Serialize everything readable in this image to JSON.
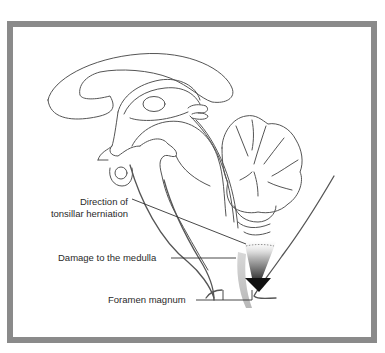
{
  "figure": {
    "frame_color": "#8a8a8a",
    "line_color": "#555555",
    "arrow_color": "#111111"
  },
  "labels": {
    "direction_line1": "Direction of",
    "direction_line2": "tonsillar herniation",
    "damage": "Damage to the medulla",
    "foramen": "Foramen magnum"
  },
  "structures": [
    {
      "name": "corpus-callosum"
    },
    {
      "name": "thalamus"
    },
    {
      "name": "brainstem"
    },
    {
      "name": "cerebellum"
    },
    {
      "name": "medulla"
    },
    {
      "name": "foramen-magnum"
    },
    {
      "name": "herniation-arrow"
    }
  ]
}
